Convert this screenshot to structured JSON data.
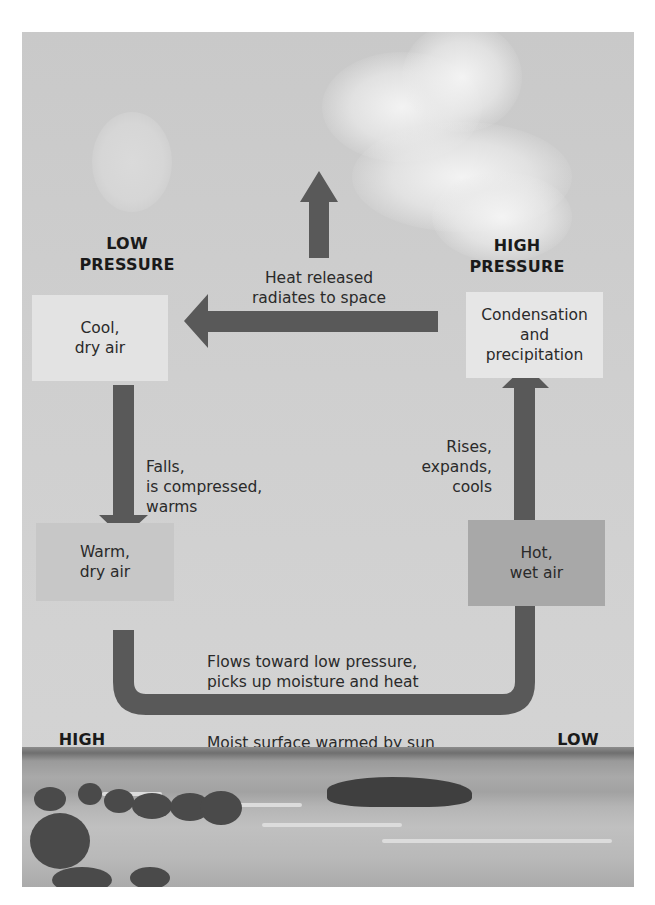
{
  "diagram": {
    "title_labels": {
      "top_left": [
        "LOW",
        "PRESSURE"
      ],
      "top_right": [
        "HIGH",
        "PRESSURE"
      ],
      "bottom_left": [
        "HIGH",
        "PRESSURE"
      ],
      "bottom_right": [
        "LOW",
        "PRESSURE"
      ]
    },
    "boxes": {
      "cool_dry": {
        "lines": [
          "Cool,",
          "dry air"
        ],
        "color": "#e3e3e3"
      },
      "condensation": {
        "lines": [
          "Condensation",
          "and",
          "precipitation"
        ],
        "color": "#e6e6e6"
      },
      "warm_dry": {
        "lines": [
          "Warm,",
          "dry air"
        ],
        "color": "#c7c7c7"
      },
      "hot_wet": {
        "lines": [
          "Hot,",
          "wet air"
        ],
        "color": "#a8a8a8"
      }
    },
    "annotations": {
      "heat_released": [
        "Heat released",
        "radiates to space"
      ],
      "falls": [
        "Falls,",
        "is compressed,",
        "warms"
      ],
      "rises": [
        "Rises,",
        "expands,",
        "cools"
      ],
      "flows": [
        "Flows toward low pressure,",
        "picks up moisture and heat"
      ],
      "moist_surface": "Moist surface warmed by sun"
    },
    "arrow_color": "#595959",
    "background_scene": [
      "sky",
      "sun",
      "cloud",
      "beach",
      "sea",
      "rock island",
      "trees"
    ]
  }
}
